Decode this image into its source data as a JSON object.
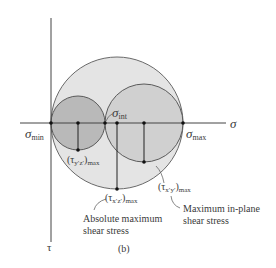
{
  "diagram": {
    "caption": "(b)",
    "axes": {
      "horizontal_label": "σ",
      "vertical_label": "τ"
    },
    "points": {
      "sigma_min": {
        "base": "σ",
        "sub": "min"
      },
      "sigma_int": {
        "base": "σ",
        "sub": "int"
      },
      "sigma_max": {
        "base": "σ",
        "sub": "max"
      }
    },
    "shear_labels": {
      "tau_yz": {
        "text": "(τ",
        "sub1": "y′z′",
        "close": ")",
        "sub2": "max"
      },
      "tau_xz": {
        "text": "(τ",
        "sub1": "x′z′",
        "close": ")",
        "sub2": "max"
      },
      "tau_xy": {
        "text": "(τ",
        "sub1": "x′y′",
        "close": ")",
        "sub2": "max"
      }
    },
    "annotations": {
      "absolute_line1": "Absolute maximum",
      "absolute_line2": "shear stress",
      "inplane_line1": "Maximum in-plane",
      "inplane_line2": "shear stress"
    },
    "colors": {
      "large_circle_fill": "#e4e4e4",
      "right_circle_fill": "#d0d0d0",
      "left_circle_fill": "#b9b9b9",
      "stroke": "#555555",
      "axis": "#444444"
    }
  }
}
